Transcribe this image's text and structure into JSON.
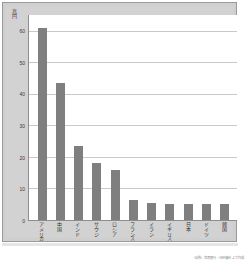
{
  "chart_data": {
    "type": "bar",
    "title": "",
    "xlabel": "",
    "ylabel": "兆円",
    "categories": [
      "アメリカ",
      "中国",
      "インド",
      "サウジ",
      "ロシア",
      "フランス",
      "イラン",
      "イギリス",
      "日本",
      "ドイツ",
      "韓国"
    ],
    "values": [
      61.0,
      43.5,
      23.5,
      18.0,
      15.8,
      6.2,
      5.3,
      5.2,
      5.1,
      5.0,
      5.0
    ],
    "ylim": [
      0,
      65
    ],
    "yticks": [
      0,
      10,
      20,
      30,
      40,
      50,
      60
    ],
    "ytick_labels": [
      "0",
      "10",
      "20",
      "30",
      "40",
      "50",
      "60"
    ],
    "grid": true,
    "legend": null,
    "bar_color": "#7f7f7f",
    "plot_background": "#ffffff",
    "panel_background": "#d2d2d2"
  },
  "footer": {
    "source_note": "（出所）世界銀行・IMF資料より作成"
  }
}
